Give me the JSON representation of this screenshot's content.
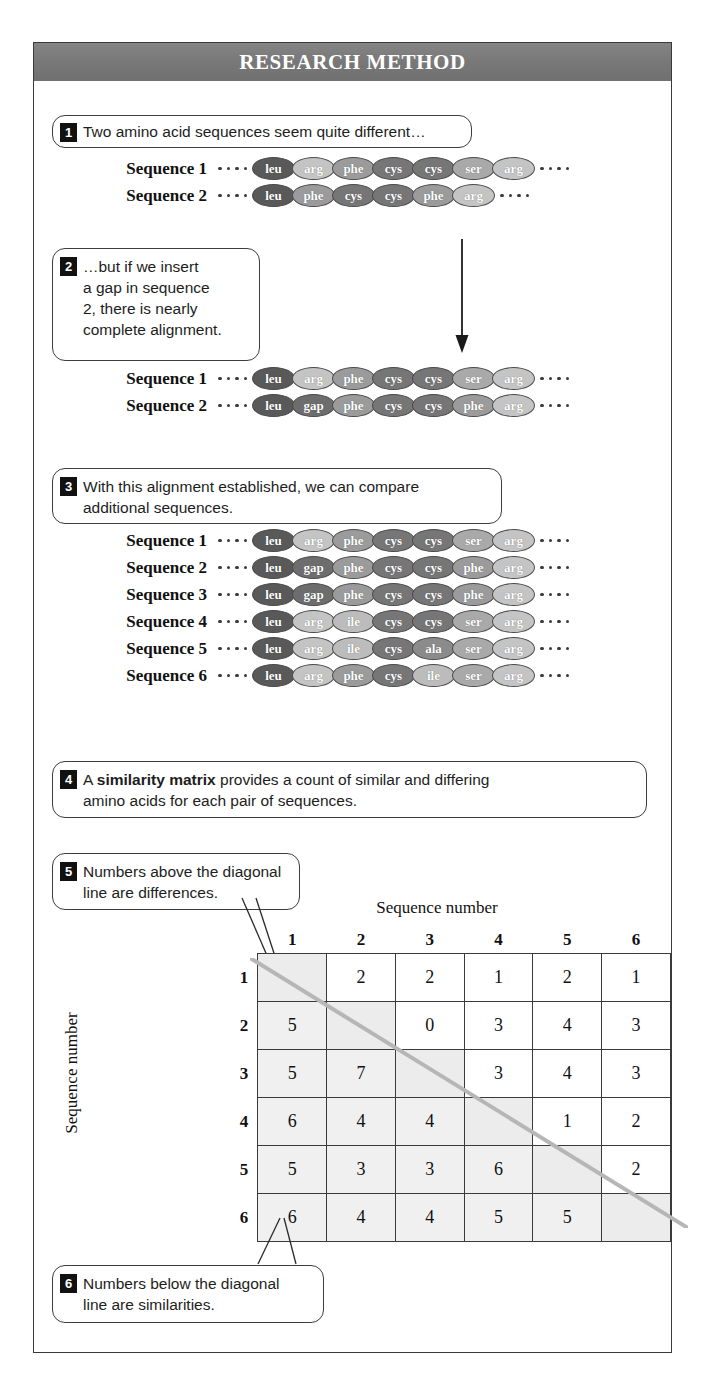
{
  "banner": {
    "title": "RESEARCH METHOD"
  },
  "callouts": [
    {
      "number": "1",
      "text": "Two amino acid sequences seem quite different…"
    },
    {
      "number": "2",
      "text": "…but if we insert\na gap in sequence\n2, there is nearly\ncomplete alignment."
    },
    {
      "number": "3",
      "text": "With this alignment established, we can compare\nadditional sequences."
    },
    {
      "number": "4",
      "text_before": "A ",
      "text_bold": "similarity matrix",
      "text_after": " provides a count of similar and differing\namino acids for each pair of sequences."
    },
    {
      "number": "5",
      "text": "Numbers above the diagonal\nline are differences."
    },
    {
      "number": "6",
      "text": "Numbers below the diagonal\nline are similarities."
    }
  ],
  "sequence_blocks": [
    {
      "id": "block-1",
      "rows": [
        {
          "label": "Sequence 1",
          "residues": [
            "leu",
            "arg",
            "phe",
            "cys",
            "cys",
            "ser",
            "arg"
          ]
        },
        {
          "label": "Sequence 2",
          "residues": [
            "leu",
            "phe",
            "cys",
            "cys",
            "phe",
            "arg"
          ]
        }
      ]
    },
    {
      "id": "block-2",
      "rows": [
        {
          "label": "Sequence 1",
          "residues": [
            "leu",
            "arg",
            "phe",
            "cys",
            "cys",
            "ser",
            "arg"
          ]
        },
        {
          "label": "Sequence 2",
          "residues": [
            "leu",
            "gap",
            "phe",
            "cys",
            "cys",
            "phe",
            "arg"
          ]
        }
      ]
    },
    {
      "id": "block-3",
      "rows": [
        {
          "label": "Sequence 1",
          "residues": [
            "leu",
            "arg",
            "phe",
            "cys",
            "cys",
            "ser",
            "arg"
          ]
        },
        {
          "label": "Sequence 2",
          "residues": [
            "leu",
            "gap",
            "phe",
            "cys",
            "cys",
            "phe",
            "arg"
          ]
        },
        {
          "label": "Sequence 3",
          "residues": [
            "leu",
            "gap",
            "phe",
            "cys",
            "cys",
            "phe",
            "arg"
          ]
        },
        {
          "label": "Sequence 4",
          "residues": [
            "leu",
            "arg",
            "ile",
            "cys",
            "cys",
            "ser",
            "arg"
          ]
        },
        {
          "label": "Sequence 5",
          "residues": [
            "leu",
            "arg",
            "ile",
            "cys",
            "ala",
            "ser",
            "arg"
          ]
        },
        {
          "label": "Sequence 6",
          "residues": [
            "leu",
            "arg",
            "phe",
            "cys",
            "ile",
            "ser",
            "arg"
          ]
        }
      ]
    }
  ],
  "residue_colors": {
    "leu": "#595959",
    "arg": "#c4c4c4",
    "phe": "#9b9b9b",
    "cys": "#767676",
    "ser": "#a9a9a9",
    "gap": "#6d6d6d",
    "ile": "#bcbcbc",
    "ala": "#8b8b8b"
  },
  "matrix": {
    "top_axis_label": "Sequence number",
    "left_axis_label": "Sequence number",
    "column_headers": [
      "1",
      "2",
      "3",
      "4",
      "5",
      "6"
    ],
    "row_headers": [
      "1",
      "2",
      "3",
      "4",
      "5",
      "6"
    ],
    "rows": [
      [
        "",
        "2",
        "2",
        "1",
        "2",
        "1"
      ],
      [
        "5",
        "",
        "0",
        "3",
        "4",
        "3"
      ],
      [
        "5",
        "7",
        "",
        "3",
        "4",
        "3"
      ],
      [
        "6",
        "4",
        "4",
        "",
        "1",
        "2"
      ],
      [
        "5",
        "3",
        "3",
        "6",
        "",
        "2"
      ],
      [
        "6",
        "4",
        "4",
        "5",
        "5",
        ""
      ]
    ],
    "diagonal_color": "#b6b6b6",
    "note_above": "differences",
    "note_below": "similarities"
  },
  "chart_data": {
    "type": "table",
    "title": "Similarity matrix",
    "xlabel": "Sequence number",
    "ylabel": "Sequence number",
    "categories": [
      "1",
      "2",
      "3",
      "4",
      "5",
      "6"
    ],
    "series": [
      {
        "name": "1",
        "values": [
          "",
          "2",
          "2",
          "1",
          "2",
          "1"
        ]
      },
      {
        "name": "2",
        "values": [
          "5",
          "",
          "0",
          "3",
          "4",
          "3"
        ]
      },
      {
        "name": "3",
        "values": [
          "5",
          "7",
          "",
          "3",
          "4",
          "3"
        ]
      },
      {
        "name": "4",
        "values": [
          "6",
          "4",
          "4",
          "",
          "1",
          "2"
        ]
      },
      {
        "name": "5",
        "values": [
          "5",
          "3",
          "3",
          "6",
          "",
          "2"
        ]
      },
      {
        "name": "6",
        "values": [
          "6",
          "4",
          "4",
          "5",
          "5",
          ""
        ]
      }
    ],
    "annotations": [
      "Numbers above the diagonal line are differences.",
      "Numbers below the diagonal line are similarities."
    ]
  }
}
